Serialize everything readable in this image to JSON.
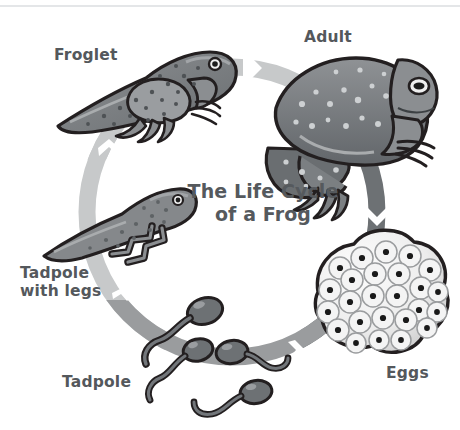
{
  "poster": {
    "title": "The Life Cycle\nof a Frog",
    "background_color": "#ffffff",
    "rule_color": "#e4e6e8"
  },
  "palette": {
    "label_text": "#54585c",
    "title_text": "#55595d",
    "ring_light": "#c7c9ca",
    "ring_medium": "#9a9c9e",
    "ring_dark": "#6d7174",
    "outline": "#231f20",
    "body_mid": "#8a8d8f",
    "body_dark": "#63676a",
    "body_light": "#b4b7b9",
    "egg_fill": "#efefef",
    "egg_dot": "#1a1a1a"
  },
  "stages": [
    {
      "id": "eggs",
      "label": "Eggs",
      "order": 1,
      "label_position": {
        "left": 386,
        "top": 364
      },
      "art": "egg-cluster"
    },
    {
      "id": "tadpole",
      "label": "Tadpole",
      "order": 2,
      "label_position": {
        "left": 62,
        "top": 373
      },
      "art": "tadpole-group"
    },
    {
      "id": "tadpole-with-legs",
      "label": "Tadpole\nwith legs",
      "order": 3,
      "label_position": {
        "left": 20,
        "top": 264
      },
      "art": "tadpole-with-legs"
    },
    {
      "id": "froglet",
      "label": "Froglet",
      "order": 4,
      "label_position": {
        "left": 54,
        "top": 46
      },
      "art": "froglet"
    },
    {
      "id": "adult",
      "label": "Adult",
      "order": 5,
      "label_position": {
        "left": 304,
        "top": 28
      },
      "art": "adult-frog"
    }
  ],
  "ring": {
    "center": {
      "x": 232,
      "y": 212
    },
    "radius": 145,
    "thickness": 17,
    "direction": "clockwise",
    "segments": [
      {
        "id": "top-arc",
        "from_stage": "froglet",
        "to_stage": "adult",
        "color": "#c7c9ca"
      },
      {
        "id": "right-arc",
        "from_stage": "adult",
        "to_stage": "eggs",
        "color": "#6d7174"
      },
      {
        "id": "bottom-arc",
        "from_stage": "tadpole",
        "to_stage": "eggs",
        "color": "#9a9c9e"
      },
      {
        "id": "left-arc",
        "from_stage": "tadpole-with-legs",
        "to_stage": "froglet",
        "color": "#c7c9ca"
      }
    ],
    "chevron_count": 4,
    "chevron_color": "#ffffff"
  }
}
